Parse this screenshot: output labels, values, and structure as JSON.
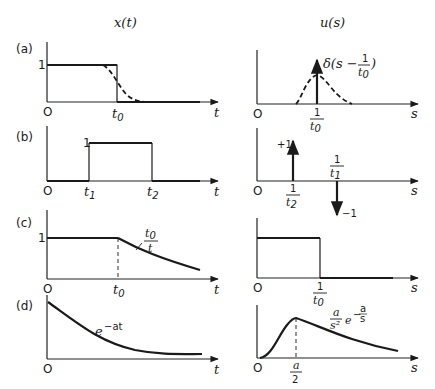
{
  "headers": {
    "left": "x(t)",
    "right": "u(s)"
  },
  "panels": [
    {
      "id": "a",
      "label": "(a)",
      "left": {
        "y_tick": "1",
        "origin": "O",
        "x_axis": "t",
        "x_tick": "t0",
        "description": "unit step down at t0 (solid) with smoothed dashed transition"
      },
      "right": {
        "origin": "O",
        "x_axis": "s",
        "x_tick_num": "1",
        "x_tick_den": "t0",
        "annotation": "δ(s − 1/t0)",
        "annotation_prefix": "δ(s −",
        "annotation_num": "1",
        "annotation_den": "t0",
        "annotation_suffix": ")",
        "description": "delta impulse at 1/t0 with dashed bell curve"
      }
    },
    {
      "id": "b",
      "label": "(b)",
      "left": {
        "y_tick": "1",
        "origin": "O",
        "x_axis": "t",
        "x_tick_1": "t1",
        "x_tick_2": "t2",
        "description": "rectangular pulse from t1 to t2"
      },
      "right": {
        "origin": "O",
        "x_axis": "s",
        "pos_impulse": "+1",
        "neg_impulse": "−1",
        "pos_tick_num": "1",
        "pos_tick_den": "t2",
        "neg_tick_num": "1",
        "neg_tick_den": "t1",
        "description": "+1 impulse at 1/t2 and −1 impulse at 1/t1"
      }
    },
    {
      "id": "c",
      "label": "(c)",
      "left": {
        "y_tick": "1",
        "origin": "O",
        "x_axis": "t",
        "x_tick": "t0",
        "curve_label_num": "t0",
        "curve_label_den": "t",
        "description": "constant 1 until t0 then decays as t0/t"
      },
      "right": {
        "origin": "O",
        "x_axis": "s",
        "x_tick_num": "1",
        "x_tick_den": "t0",
        "description": "box from 0 to 1/t0"
      }
    },
    {
      "id": "d",
      "label": "(d)",
      "left": {
        "origin": "O",
        "x_axis": "t",
        "curve_label": "e^−at",
        "curve_base": "e",
        "curve_exp": "−at",
        "description": "exponential decay"
      },
      "right": {
        "origin": "O",
        "x_axis": "s",
        "x_tick_num": "a",
        "x_tick_den": "2",
        "curve_label": "(a/s²) e^(−a/s)",
        "curve_num": "a",
        "curve_den": "s²",
        "curve_e": "e",
        "curve_exp_sign": "−",
        "curve_exp_num": "a",
        "curve_exp_den": "s",
        "description": "curve peaking at a/2"
      }
    }
  ]
}
